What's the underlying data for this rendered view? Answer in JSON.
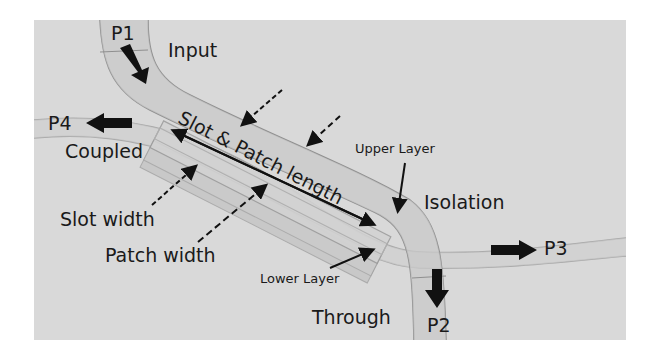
{
  "diagram": {
    "background_color": "#d9d9d9",
    "ports": [
      {
        "id": "P1",
        "label": "P1",
        "role": "Input",
        "arrow_dir": "down-right"
      },
      {
        "id": "P2",
        "label": "P2",
        "role": "Through",
        "arrow_dir": "down"
      },
      {
        "id": "P3",
        "label": "P3",
        "role": "Isolation",
        "arrow_dir": "right"
      },
      {
        "id": "P4",
        "label": "P4",
        "role": "Coupled",
        "arrow_dir": "left"
      }
    ],
    "labels": {
      "input": "Input",
      "coupled": "Coupled",
      "isolation": "Isolation",
      "through": "Through",
      "upper_layer": "Upper Layer",
      "lower_layer": "Lower Layer",
      "slot_width": "Slot width",
      "patch_width": "Patch width",
      "slot_patch_length": "Slot & Patch length"
    }
  }
}
